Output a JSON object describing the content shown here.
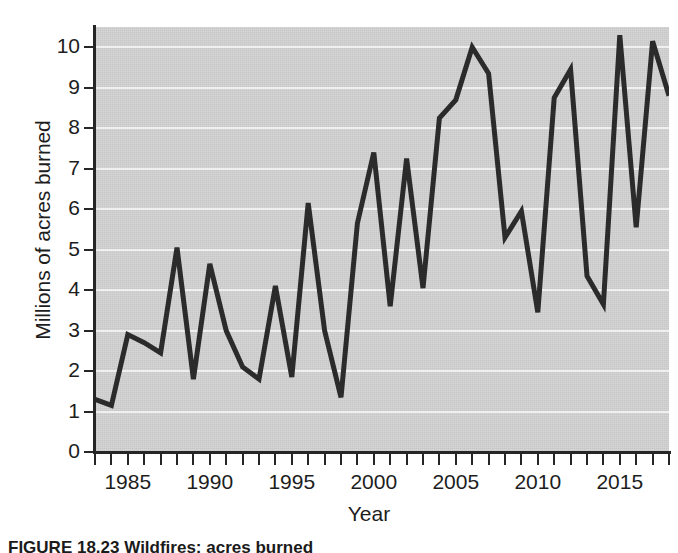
{
  "figure": {
    "caption_label": "FIGURE 18.23",
    "caption_text": "Wildfires: acres burned",
    "bleed_text": ""
  },
  "chart_data": {
    "type": "line",
    "title": "",
    "xlabel": "Year",
    "ylabel": "Millions of acres burned",
    "xlim": [
      1983,
      2018
    ],
    "ylim": [
      0,
      10.5
    ],
    "ytick_values": [
      0,
      1,
      2,
      3,
      4,
      5,
      6,
      7,
      8,
      9,
      10
    ],
    "ytick_labels": [
      "0",
      "1",
      "2",
      "3",
      "4",
      "5",
      "6",
      "7",
      "8",
      "9",
      "10"
    ],
    "xtick_values": [
      1985,
      1990,
      1995,
      2000,
      2005,
      2010,
      2015
    ],
    "xtick_labels": [
      "1985",
      "1990",
      "1995",
      "2000",
      "2005",
      "2010",
      "2015"
    ],
    "grid": true,
    "grid_axis": "y",
    "legend": "none",
    "line_color": "#2b2b2b",
    "plot_background": "#d2d2d2",
    "gridline_color": "#f2f2f2",
    "x": [
      1983,
      1984,
      1985,
      1986,
      1987,
      1988,
      1989,
      1990,
      1991,
      1992,
      1993,
      1994,
      1995,
      1996,
      1997,
      1998,
      1999,
      2000,
      2001,
      2002,
      2003,
      2004,
      2005,
      2006,
      2007,
      2008,
      2009,
      2010,
      2011,
      2012,
      2013,
      2014,
      2015,
      2016,
      2017,
      2018
    ],
    "values": [
      1.3,
      1.15,
      2.9,
      2.7,
      2.45,
      5.05,
      1.8,
      4.65,
      3.0,
      2.1,
      1.8,
      4.1,
      1.85,
      6.15,
      3.0,
      1.35,
      5.65,
      7.4,
      3.6,
      7.25,
      4.05,
      8.25,
      8.7,
      10.0,
      9.35,
      5.3,
      5.95,
      3.45,
      8.75,
      9.45,
      4.35,
      3.65,
      10.3,
      5.55,
      10.15,
      8.8
    ]
  }
}
